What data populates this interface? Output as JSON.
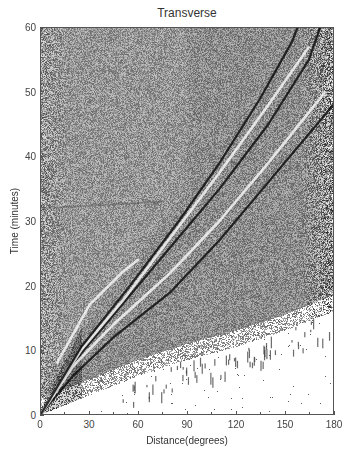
{
  "chart_data": {
    "type": "heatmap",
    "title": "Transverse",
    "xlabel": "Distance(degrees)",
    "ylabel": "Time (minutes)",
    "xlim": [
      0,
      180
    ],
    "ylim": [
      0,
      60
    ],
    "x_ticks": [
      0,
      30,
      60,
      90,
      120,
      150,
      180
    ],
    "y_ticks": [
      0,
      10,
      20,
      30,
      40,
      50,
      60
    ],
    "x_tick_labels": [
      "0",
      "30",
      "60",
      "90",
      "120",
      "150",
      "180"
    ],
    "y_tick_labels": [
      "0",
      "10",
      "20",
      "30",
      "40",
      "50",
      "60"
    ],
    "colormap": "grayscale",
    "grid": false,
    "phase_curves": [
      {
        "name": "S",
        "style": "dark",
        "points": [
          [
            0,
            0
          ],
          [
            20,
            6
          ],
          [
            45,
            12
          ],
          [
            80,
            19
          ],
          [
            110,
            27
          ],
          [
            140,
            36
          ],
          [
            170,
            45
          ],
          [
            180,
            48
          ]
        ]
      },
      {
        "name": "ScS-like",
        "style": "light",
        "points": [
          [
            0,
            0
          ],
          [
            20,
            7.5
          ],
          [
            45,
            14
          ],
          [
            80,
            22
          ],
          [
            110,
            30
          ],
          [
            140,
            39
          ],
          [
            175,
            50
          ]
        ]
      },
      {
        "name": "SS",
        "style": "dark",
        "points": [
          [
            0,
            0
          ],
          [
            20,
            8
          ],
          [
            45,
            15.5
          ],
          [
            80,
            26
          ],
          [
            110,
            35
          ],
          [
            140,
            45
          ],
          [
            165,
            55
          ],
          [
            172,
            60
          ]
        ]
      },
      {
        "name": "SS-light",
        "style": "light",
        "points": [
          [
            0,
            0
          ],
          [
            25,
            10
          ],
          [
            50,
            17.5
          ],
          [
            80,
            27.5
          ],
          [
            110,
            37.5
          ],
          [
            140,
            48
          ],
          [
            165,
            57
          ]
        ]
      },
      {
        "name": "SSS",
        "style": "dark",
        "points": [
          [
            0,
            0
          ],
          [
            25,
            10.5
          ],
          [
            55,
            20
          ],
          [
            85,
            30
          ],
          [
            110,
            39
          ],
          [
            135,
            49
          ],
          [
            155,
            58
          ],
          [
            158,
            60
          ]
        ]
      },
      {
        "name": "surface",
        "style": "light",
        "points": [
          [
            10,
            8
          ],
          [
            30,
            17
          ],
          [
            50,
            22
          ],
          [
            60,
            24
          ]
        ]
      }
    ],
    "first_arrival_boundary": [
      [
        0,
        0
      ],
      [
        30,
        3
      ],
      [
        60,
        6
      ],
      [
        90,
        8.5
      ],
      [
        120,
        10.5
      ],
      [
        150,
        13
      ],
      [
        180,
        16
      ]
    ],
    "faint_horizontal_feature": {
      "x_range": [
        0,
        75
      ],
      "y": 32
    }
  },
  "colors": {
    "background": "#ffffff",
    "plot_mid_gray": "#8a8a8a",
    "axis": "#555555",
    "text": "#333333"
  },
  "seed": 12345
}
